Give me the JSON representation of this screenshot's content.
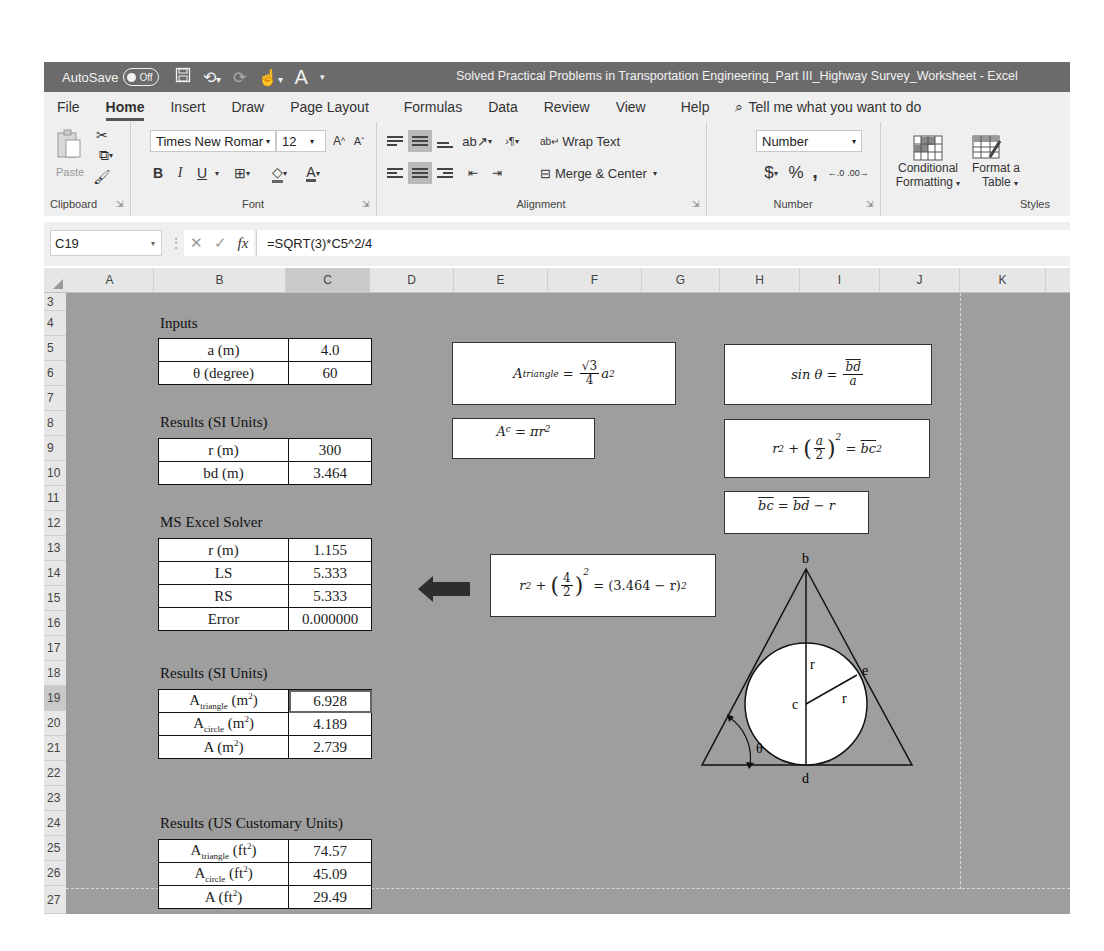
{
  "titlebar": {
    "autosave_label": "AutoSave",
    "autosave_state": "Off",
    "qat_icons": [
      "save-icon",
      "undo-icon",
      "redo-icon",
      "touch-mode-icon",
      "font-color-icon",
      "customize-icon"
    ],
    "document_title": "Solved Practical Problems in Transportation Engineering_Part III_Highway Survey_Worksheet  -  Excel"
  },
  "ribbon": {
    "tabs": [
      "File",
      "Home",
      "Insert",
      "Draw",
      "Page Layout",
      "Formulas",
      "Data",
      "Review",
      "View",
      "Help"
    ],
    "active_tab": "Home",
    "tell_me_placeholder": "Tell me what you want to do",
    "groups": {
      "clipboard": {
        "label": "Clipboard",
        "paste_label": "Paste"
      },
      "font": {
        "label": "Font",
        "font_name": "Times New Romar",
        "font_size": "12",
        "bold": "B",
        "italic": "I",
        "underline": "U"
      },
      "alignment": {
        "label": "Alignment",
        "wrap_text": "Wrap Text",
        "merge_center": "Merge & Center"
      },
      "number": {
        "label": "Number",
        "format": "Number",
        "currency": "$",
        "percent": "%",
        "comma": ","
      },
      "styles": {
        "label": "Styles",
        "conditional_formatting_line1": "Conditional",
        "conditional_formatting_line2": "Formatting",
        "format_as_table_line1": "Format a",
        "format_as_table_line2": "Table"
      }
    }
  },
  "formula_bar": {
    "name_box": "C19",
    "formula": "=SQRT(3)*C5^2/4"
  },
  "grid": {
    "columns": [
      "A",
      "B",
      "C",
      "D",
      "E",
      "F",
      "G",
      "H",
      "I",
      "J",
      "K"
    ],
    "selected_column": "C",
    "rows": [
      "3",
      "4",
      "5",
      "6",
      "7",
      "8",
      "9",
      "10",
      "11",
      "12",
      "13",
      "14",
      "15",
      "16",
      "17",
      "18",
      "19",
      "20",
      "21",
      "22",
      "23",
      "24",
      "25",
      "26",
      "27"
    ],
    "selected_row": "19"
  },
  "sheet": {
    "inputs": {
      "title": "Inputs",
      "rows": [
        {
          "label": "a (m)",
          "value": "4.0"
        },
        {
          "label": "θ (degree)",
          "value": "60"
        }
      ]
    },
    "results_si_1": {
      "title": "Results (SI Units)",
      "rows": [
        {
          "label": "r (m)",
          "value": "300"
        },
        {
          "label": "bd (m)",
          "value": "3.464"
        }
      ]
    },
    "solver": {
      "title": "MS Excel Solver",
      "rows": [
        {
          "label": "r (m)",
          "value": "1.155"
        },
        {
          "label": "LS",
          "value": "5.333"
        },
        {
          "label": "RS",
          "value": "5.333"
        },
        {
          "label": "Error",
          "value": "0.000000"
        }
      ]
    },
    "results_si_2": {
      "title": "Results (SI Units)",
      "rows": [
        {
          "label_main": "A",
          "label_sub": "triangle",
          "label_unit": " (m",
          "label_sup": "2",
          "label_end": ")",
          "value": "6.928"
        },
        {
          "label_main": "A",
          "label_sub": "circle",
          "label_unit": " (m",
          "label_sup": "2",
          "label_end": ")",
          "value": "4.189"
        },
        {
          "label_main": "A",
          "label_sub": "",
          "label_unit": " (m",
          "label_sup": "2",
          "label_end": ")",
          "value": "2.739"
        }
      ]
    },
    "results_us": {
      "title": "Results (US Customary Units)",
      "rows": [
        {
          "label_main": "A",
          "label_sub": "triangle",
          "label_unit": " (ft",
          "label_sup": "2",
          "label_end": ")",
          "value": "74.57"
        },
        {
          "label_main": "A",
          "label_sub": "circle",
          "label_unit": " (ft",
          "label_sup": "2",
          "label_end": ")",
          "value": "45.09"
        },
        {
          "label_main": "A",
          "label_sub": "",
          "label_unit": " (ft",
          "label_sup": "2",
          "label_end": ")",
          "value": "29.49"
        }
      ]
    },
    "equations": {
      "triangle_area": {
        "lhs": "A",
        "lhs_sub": "triangle",
        "eq": " = ",
        "num": "√3",
        "den": "4",
        "rhs": "a",
        "rhs_sup": "2"
      },
      "circle_area": {
        "lhs": "A",
        "lhs_sub": "c",
        "eq": " = πr",
        "sup": "2"
      },
      "sin_theta": {
        "lhs": "sin θ = ",
        "num": "bd",
        "den": "a"
      },
      "pythag": {
        "a": "r",
        "a_sup": "2",
        "plus": " + ",
        "num": "a",
        "den": "2",
        "paren_sup": "2",
        "eq": " = ",
        "rhs": "bc",
        "rhs_sup": "2"
      },
      "bc": {
        "lhs": "bc",
        "eq": " = ",
        "mid": "bd",
        "rest": " − r"
      },
      "solver_eq": {
        "a": "r",
        "a_sup": "2",
        "plus": " + ",
        "num": "4",
        "den": "2",
        "paren_sup": "2",
        "eq": " = (3.464 − r)",
        "rhs_sup": "2"
      }
    },
    "diagram": {
      "labels": {
        "top": "b",
        "center": "c",
        "tangent": "e",
        "bottom": "d",
        "radius1": "r",
        "radius2": "r",
        "angle": "θ"
      }
    }
  },
  "colors": {
    "titlebar_bg": "#6b6b6b",
    "ribbon_bg": "#efefef",
    "sheet_bg": "#9e9e9e",
    "header_bg": "#e6e6e6",
    "arrow": "#2e2e2e"
  }
}
